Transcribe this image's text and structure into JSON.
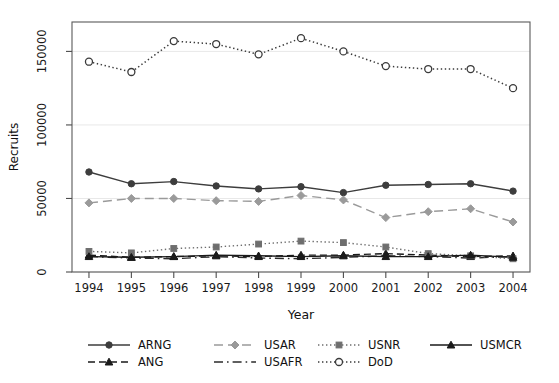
{
  "chart_data": {
    "type": "line",
    "title": "",
    "xlabel": "Year",
    "ylabel": "Recruits",
    "x": [
      1994,
      1995,
      1996,
      1997,
      1998,
      1999,
      2000,
      2001,
      2002,
      2003,
      2004
    ],
    "xticklabels": [
      "1994",
      "1995",
      "1996",
      "1997",
      "1998",
      "1999",
      "2000",
      "2001",
      "2002",
      "2003",
      "2004"
    ],
    "yticklabels": [
      "0",
      "50000",
      "100000",
      "150000"
    ],
    "yticks": [
      0,
      50000,
      100000,
      150000
    ],
    "xlim": [
      1993.6,
      2004.4
    ],
    "ylim": [
      0,
      170000
    ],
    "grid": "horizontal-light",
    "legend_position": "bottom",
    "legend_columns": 4,
    "series": [
      {
        "name": "ARNG",
        "color": "#3d3d3d",
        "marker": "circle-filled",
        "dash": "solid",
        "values": [
          68000,
          60000,
          61500,
          58500,
          56500,
          58000,
          54000,
          59000,
          59500,
          60000,
          55000
        ]
      },
      {
        "name": "ANG",
        "color": "#1a1a1a",
        "marker": "triangle-filled",
        "dash": "dashed",
        "values": [
          11500,
          10000,
          10500,
          11000,
          10500,
          11500,
          11500,
          12500,
          11500,
          10500,
          11000
        ]
      },
      {
        "name": "USAR",
        "color": "#9a9a9a",
        "marker": "diamond-filled",
        "dash": "longdash",
        "values": [
          47000,
          50000,
          50000,
          48500,
          48000,
          52000,
          49000,
          37000,
          41000,
          43000,
          34000
        ]
      },
      {
        "name": "USAFR",
        "color": "#2b2b2b",
        "marker": "none",
        "dash": "dashdot",
        "values": [
          10500,
          9500,
          9000,
          10500,
          9500,
          9000,
          10000,
          11000,
          10500,
          9500,
          10500
        ]
      },
      {
        "name": "USNR",
        "color": "#6e6e6e",
        "marker": "square-filled",
        "dash": "dotted",
        "values": [
          14000,
          13000,
          16000,
          17000,
          19000,
          21000,
          20000,
          17000,
          12500,
          11000,
          9000
        ]
      },
      {
        "name": "DoD",
        "color": "#3a3a3a",
        "marker": "circle-open",
        "dash": "dotted",
        "values": [
          143000,
          136000,
          157000,
          155000,
          148000,
          159000,
          150000,
          140000,
          138000,
          138000,
          125000
        ]
      },
      {
        "name": "USMCR",
        "color": "#1a1a1a",
        "marker": "triangle-filled",
        "dash": "solid",
        "values": [
          10500,
          10000,
          10500,
          11500,
          11000,
          10500,
          11000,
          10500,
          10500,
          11500,
          10000
        ]
      }
    ]
  },
  "legend": {
    "entries": [
      {
        "label": "ARNG"
      },
      {
        "label": "USAR"
      },
      {
        "label": "USNR"
      },
      {
        "label": "USMCR"
      },
      {
        "label": "ANG"
      },
      {
        "label": "USAFR"
      },
      {
        "label": "DoD"
      }
    ]
  }
}
